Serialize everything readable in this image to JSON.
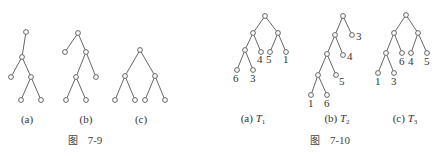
{
  "figures": [
    {
      "id": "fig-7-9",
      "caption": {
        "prefix": "图",
        "number": "7-9",
        "x": 85,
        "y": 144
      },
      "subfigures": [
        {
          "label": "(a)",
          "label_x": 27,
          "label_y": 123,
          "nodes": [
            {
              "id": "r",
              "x": 26,
              "y": 32
            },
            {
              "id": "a",
              "x": 22,
              "y": 57
            },
            {
              "id": "b",
              "x": 11,
              "y": 77
            },
            {
              "id": "c",
              "x": 31,
              "y": 77
            },
            {
              "id": "d",
              "x": 21,
              "y": 100
            },
            {
              "id": "e",
              "x": 41,
              "y": 100
            }
          ],
          "edges": [
            [
              "r",
              "a"
            ],
            [
              "a",
              "b"
            ],
            [
              "a",
              "c"
            ],
            [
              "c",
              "d"
            ],
            [
              "c",
              "e"
            ]
          ]
        },
        {
          "label": "(b)",
          "label_x": 86,
          "label_y": 123,
          "nodes": [
            {
              "id": "r",
              "x": 78,
              "y": 33
            },
            {
              "id": "a",
              "x": 65,
              "y": 52
            },
            {
              "id": "b",
              "x": 86,
              "y": 52
            },
            {
              "id": "c",
              "x": 76,
              "y": 77
            },
            {
              "id": "d",
              "x": 96,
              "y": 77
            },
            {
              "id": "e",
              "x": 66,
              "y": 100
            },
            {
              "id": "f",
              "x": 86,
              "y": 100
            }
          ],
          "edges": [
            [
              "r",
              "a"
            ],
            [
              "r",
              "b"
            ],
            [
              "b",
              "c"
            ],
            [
              "b",
              "d"
            ],
            [
              "c",
              "e"
            ],
            [
              "c",
              "f"
            ]
          ]
        },
        {
          "label": "(c)",
          "label_x": 141,
          "label_y": 123,
          "nodes": [
            {
              "id": "r",
              "x": 140,
              "y": 50
            },
            {
              "id": "a",
              "x": 125,
              "y": 76
            },
            {
              "id": "b",
              "x": 155,
              "y": 76
            },
            {
              "id": "c",
              "x": 115,
              "y": 100
            },
            {
              "id": "d",
              "x": 135,
              "y": 100
            },
            {
              "id": "e",
              "x": 145,
              "y": 100
            },
            {
              "id": "f",
              "x": 165,
              "y": 100
            }
          ],
          "edges": [
            [
              "r",
              "a"
            ],
            [
              "r",
              "b"
            ],
            [
              "a",
              "c"
            ],
            [
              "a",
              "d"
            ],
            [
              "b",
              "e"
            ],
            [
              "b",
              "f"
            ]
          ]
        }
      ]
    },
    {
      "id": "fig-7-10",
      "caption": {
        "prefix": "图",
        "number": "7-10",
        "x": 330,
        "y": 144
      },
      "subfigures": [
        {
          "label": "(a) ",
          "tree": "T",
          "sub": "1",
          "label_x": 253,
          "label_y": 122,
          "nodes": [
            {
              "id": "r",
              "x": 265,
              "y": 16
            },
            {
              "id": "a",
              "x": 253,
              "y": 33
            },
            {
              "id": "b",
              "x": 278,
              "y": 33
            },
            {
              "id": "c",
              "x": 245,
              "y": 50
            },
            {
              "id": "d",
              "x": 261,
              "y": 52,
              "w": "4",
              "lx": 257,
              "ly": 63
            },
            {
              "id": "e",
              "x": 270,
              "y": 52,
              "w": "5",
              "lx": 266,
              "ly": 63
            },
            {
              "id": "f",
              "x": 286,
              "y": 52,
              "w": "1",
              "lx": 283,
              "ly": 63
            },
            {
              "id": "g",
              "x": 237,
              "y": 70,
              "w": "6",
              "lx": 233,
              "ly": 82
            },
            {
              "id": "h",
              "x": 253,
              "y": 70,
              "w": "3",
              "lx": 250,
              "ly": 82
            }
          ],
          "edges": [
            [
              "r",
              "a"
            ],
            [
              "r",
              "b"
            ],
            [
              "a",
              "c"
            ],
            [
              "a",
              "d"
            ],
            [
              "b",
              "e"
            ],
            [
              "b",
              "f"
            ],
            [
              "c",
              "g"
            ],
            [
              "c",
              "h"
            ]
          ]
        },
        {
          "label": "(b) ",
          "tree": "T",
          "sub": "2",
          "label_x": 337,
          "label_y": 122,
          "nodes": [
            {
              "id": "r",
              "x": 343,
              "y": 16
            },
            {
              "id": "a",
              "x": 335,
              "y": 35
            },
            {
              "id": "b",
              "x": 352,
              "y": 35,
              "w": "3",
              "lx": 356,
              "ly": 40
            },
            {
              "id": "c",
              "x": 327,
              "y": 54
            },
            {
              "id": "d",
              "x": 343,
              "y": 55,
              "w": "4",
              "lx": 347,
              "ly": 60
            },
            {
              "id": "e",
              "x": 318,
              "y": 75
            },
            {
              "id": "f",
              "x": 336,
              "y": 75,
              "w": "5",
              "lx": 339,
              "ly": 85
            },
            {
              "id": "g",
              "x": 311,
              "y": 95,
              "w": "1",
              "lx": 308,
              "ly": 107
            },
            {
              "id": "h",
              "x": 327,
              "y": 95,
              "w": "6",
              "lx": 324,
              "ly": 107
            }
          ],
          "edges": [
            [
              "r",
              "a"
            ],
            [
              "r",
              "b"
            ],
            [
              "a",
              "c"
            ],
            [
              "a",
              "d"
            ],
            [
              "c",
              "e"
            ],
            [
              "c",
              "f"
            ],
            [
              "e",
              "g"
            ],
            [
              "e",
              "h"
            ]
          ]
        },
        {
          "label": "(c) ",
          "tree": "T",
          "sub": "3",
          "label_x": 405,
          "label_y": 122,
          "nodes": [
            {
              "id": "r",
              "x": 406,
              "y": 15
            },
            {
              "id": "a",
              "x": 394,
              "y": 33
            },
            {
              "id": "b",
              "x": 418,
              "y": 33
            },
            {
              "id": "c",
              "x": 386,
              "y": 53
            },
            {
              "id": "d",
              "x": 402,
              "y": 53,
              "w": "6",
              "lx": 399,
              "ly": 65
            },
            {
              "id": "e",
              "x": 411,
              "y": 53,
              "w": "4",
              "lx": 408,
              "ly": 65
            },
            {
              "id": "f",
              "x": 427,
              "y": 53,
              "w": "5",
              "lx": 424,
              "ly": 65
            },
            {
              "id": "g",
              "x": 378,
              "y": 73,
              "w": "1",
              "lx": 375,
              "ly": 85
            },
            {
              "id": "h",
              "x": 394,
              "y": 73,
              "w": "3",
              "lx": 391,
              "ly": 85
            }
          ],
          "edges": [
            [
              "r",
              "a"
            ],
            [
              "r",
              "b"
            ],
            [
              "a",
              "c"
            ],
            [
              "a",
              "d"
            ],
            [
              "b",
              "e"
            ],
            [
              "b",
              "f"
            ],
            [
              "c",
              "g"
            ],
            [
              "c",
              "h"
            ]
          ]
        }
      ]
    }
  ]
}
